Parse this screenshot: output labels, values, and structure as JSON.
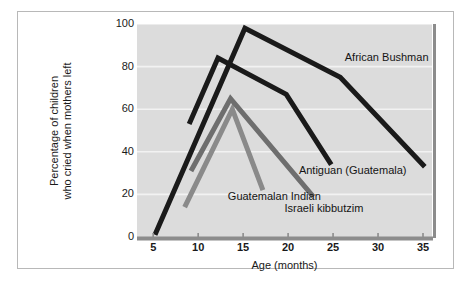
{
  "figure": {
    "background_color": "#ffffff",
    "frame_color": "#b8b8b8",
    "panel_color": "#dcdcdc"
  },
  "chart_data": {
    "type": "line",
    "title": "",
    "subtitle": "",
    "xlabel": "Age (months)",
    "ylabel": "Percentage of children who cried when mothers left",
    "ylabel_line1": "Percentage of children",
    "ylabel_line2": "who cried when mothers left",
    "xlim": [
      3.2,
      36.0
    ],
    "ylim": [
      0,
      100
    ],
    "xticks": [
      5,
      10,
      15,
      20,
      25,
      30,
      35
    ],
    "xtick_labels": [
      "5",
      "10",
      "15",
      "20",
      "25",
      "30",
      "35"
    ],
    "yticks": [
      0,
      20,
      40,
      60,
      80,
      100
    ],
    "ytick_labels": [
      "0",
      "20",
      "40",
      "60",
      "80",
      "100"
    ],
    "grid": "horizontal-white-gridlines",
    "legend": "inline-annotations",
    "axis_line_color": "#8c8c8c",
    "gridline_color": "#f2f2f2",
    "series": [
      {
        "name": "African Bushman",
        "color": "#1a1a1a",
        "line_width": 5,
        "label_x": 26.3,
        "label_y": 84,
        "x": [
          5.2,
          15.2,
          25.8,
          35.2
        ],
        "y": [
          1,
          98,
          75,
          33
        ]
      },
      {
        "name": "Antiguan (Guatemala)",
        "color": "#1a1a1a",
        "line_width": 5,
        "label_x": 21.2,
        "label_y": 31,
        "x": [
          9.0,
          12.2,
          19.8,
          24.8
        ],
        "y": [
          53,
          84,
          67,
          34
        ]
      },
      {
        "name": "Guatemalan Indian",
        "color": "#8a8a8a",
        "line_width": 5,
        "label_x": 13.3,
        "label_y": 19,
        "x": [
          8.5,
          13.8,
          17.2
        ],
        "y": [
          14,
          60,
          22
        ]
      },
      {
        "name": "Israeli kibbutzim",
        "color": "#6e6e6e",
        "line_width": 5,
        "label_x": 19.6,
        "label_y": 13,
        "x": [
          9.2,
          13.6,
          22.8
        ],
        "y": [
          31,
          65,
          19
        ]
      }
    ]
  }
}
